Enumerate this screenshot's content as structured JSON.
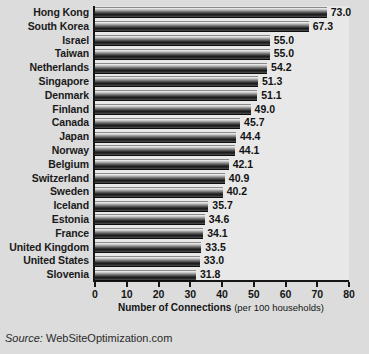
{
  "chart_data": {
    "type": "bar",
    "orientation": "horizontal",
    "title": "",
    "xlabel": "Number of Connections (per 100 households)",
    "xlabel_bold_part": "Number of Connections",
    "xlabel_regular_part": "(per 100 households)",
    "ylabel": "",
    "xlim": [
      0,
      80
    ],
    "xticks": [
      0,
      10,
      20,
      30,
      40,
      50,
      60,
      70,
      80
    ],
    "grid": false,
    "legend": false,
    "value_label_format": "one-decimal",
    "categories": [
      "Hong Kong",
      "South Korea",
      "Israel",
      "Taiwan",
      "Netherlands",
      "Singapore",
      "Denmark",
      "Finland",
      "Canada",
      "Japan",
      "Norway",
      "Belgium",
      "Switzerland",
      "Sweden",
      "Iceland",
      "Estonia",
      "France",
      "United Kingdom",
      "United States",
      "Slovenia"
    ],
    "values": [
      73.0,
      67.3,
      55.0,
      55.0,
      54.2,
      51.3,
      51.1,
      49.0,
      45.7,
      44.4,
      44.1,
      42.1,
      40.9,
      40.2,
      35.7,
      34.6,
      34.1,
      33.5,
      33.0,
      31.8
    ],
    "value_labels": [
      "73.0",
      "67.3",
      "55.0",
      "55.0",
      "54.2",
      "51.3",
      "51.1",
      "49.0",
      "45.7",
      "44.4",
      "44.1",
      "42.1",
      "40.9",
      "40.2",
      "35.7",
      "34.6",
      "34.1",
      "33.5",
      "33.0",
      "31.8"
    ],
    "tick_labels": [
      "0",
      "10",
      "20",
      "30",
      "40",
      "50",
      "60",
      "70",
      "80"
    ]
  },
  "source": {
    "prefix": "Source:",
    "name": "WebSiteOptimization.com"
  },
  "colors": {
    "page_background": "#dcdcdc",
    "plot_background": "#e8e8e8",
    "axis": "#161616",
    "text": "#141414",
    "bar_light": "#f4f4f4",
    "bar_dark": "#1c1c1c"
  }
}
